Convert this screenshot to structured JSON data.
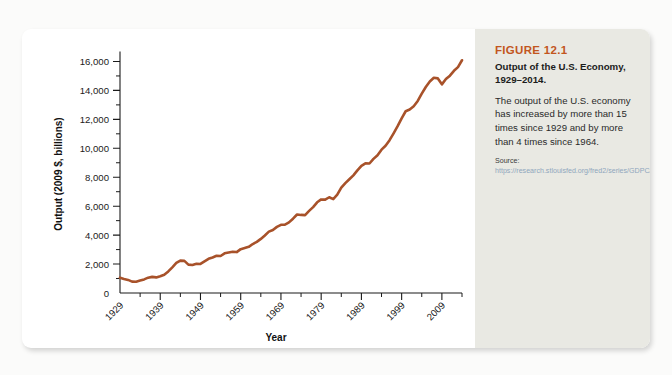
{
  "figure": {
    "number": "FIGURE 12.1",
    "title": "Output of the U.S. Economy, 1929–2014.",
    "description": "The output of the U.S. economy has increased by more than 15 times since 1929 and by more than 4 times since 1964.",
    "source_label": "Source:",
    "source_url": "https://research.stlouisfed.org/fred2/series/GDPCA.",
    "accent_color": "#c2561e",
    "panel_color": "#e9e9e3",
    "line_color": "#a8522a"
  },
  "chart_data": {
    "type": "line",
    "title": "Output of the U.S. Economy, 1929–2014",
    "xlabel": "Year",
    "ylabel": "Output (2009 $, billions)",
    "xlim": [
      1929,
      2014
    ],
    "ylim": [
      0,
      17000
    ],
    "grid": false,
    "legend": null,
    "y_ticks_major": [
      0,
      2000,
      4000,
      6000,
      8000,
      10000,
      12000,
      14000,
      16000
    ],
    "y_tick_labels": [
      "0",
      "2,000",
      "4,000",
      "6,000",
      "8,000",
      "10,000",
      "12,000",
      "14,000",
      "16,000"
    ],
    "y_tick_minor_step": 1000,
    "x_ticks_major": [
      1929,
      1939,
      1949,
      1959,
      1969,
      1979,
      1989,
      1999,
      2009
    ],
    "x_tick_labels": [
      "1929",
      "1939",
      "1949",
      "1959",
      "1969",
      "1979",
      "1989",
      "1999",
      "2009"
    ],
    "x_tick_minor_step": 5,
    "series": [
      {
        "name": "Real GDP (2009 $, billions)",
        "x": [
          1929,
          1930,
          1931,
          1932,
          1933,
          1934,
          1935,
          1936,
          1937,
          1938,
          1939,
          1940,
          1941,
          1942,
          1943,
          1944,
          1945,
          1946,
          1947,
          1948,
          1949,
          1950,
          1951,
          1952,
          1953,
          1954,
          1955,
          1956,
          1957,
          1958,
          1959,
          1960,
          1961,
          1962,
          1963,
          1964,
          1965,
          1966,
          1967,
          1968,
          1969,
          1970,
          1971,
          1972,
          1973,
          1974,
          1975,
          1976,
          1977,
          1978,
          1979,
          1980,
          1981,
          1982,
          1983,
          1984,
          1985,
          1986,
          1987,
          1988,
          1989,
          1990,
          1991,
          1992,
          1993,
          1994,
          1995,
          1996,
          1997,
          1998,
          1999,
          2000,
          2001,
          2002,
          2003,
          2004,
          2005,
          2006,
          2007,
          2008,
          2009,
          2010,
          2011,
          2012,
          2013,
          2014
        ],
        "values": [
          1057,
          966,
          904,
          788,
          778,
          862,
          939,
          1060,
          1115,
          1078,
          1164,
          1266,
          1490,
          1772,
          2074,
          2240,
          2218,
          1962,
          1940,
          2021,
          2009,
          2185,
          2361,
          2456,
          2571,
          2556,
          2740,
          2798,
          2854,
          2828,
          3030,
          3109,
          3189,
          3384,
          3533,
          3737,
          3977,
          4238,
          4356,
          4567,
          4713,
          4723,
          4878,
          5134,
          5424,
          5396,
          5385,
          5675,
          5937,
          6267,
          6466,
          6450,
          6617,
          6491,
          6792,
          7285,
          7594,
          7861,
          8133,
          8475,
          8786,
          8955,
          8948,
          9267,
          9521,
          9906,
          10175,
          10561,
          11035,
          11526,
          12066,
          12560,
          12682,
          12909,
          13271,
          13774,
          14234,
          14614,
          14874,
          14830,
          14419,
          14784,
          15021,
          15355,
          15612,
          16085
        ]
      }
    ]
  }
}
